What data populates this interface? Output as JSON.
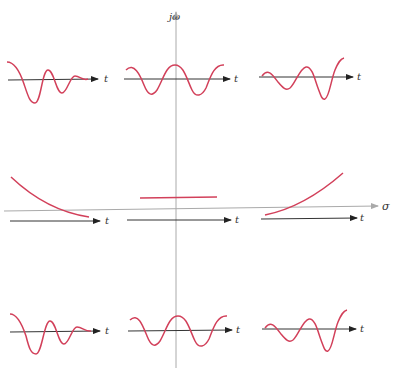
{
  "figure": {
    "axes": {
      "vertical_label": "jω",
      "horizontal_label": "σ"
    },
    "time_axis_label": "t",
    "colors": {
      "signal": "#d2405a",
      "time_axis": "#333333",
      "s_plane_axis": "#aaaaaa"
    },
    "panels": [
      {
        "row": "top",
        "col": "left",
        "description": "decaying oscillation (LHP complex pole)",
        "t_label": "t"
      },
      {
        "row": "top",
        "col": "center",
        "description": "constant-amplitude oscillation (jω-axis pole)",
        "t_label": "t"
      },
      {
        "row": "top",
        "col": "right",
        "description": "growing oscillation (RHP complex pole)",
        "t_label": "t"
      },
      {
        "row": "middle",
        "col": "left",
        "description": "decaying exponential (LHP real pole)",
        "t_label": "t"
      },
      {
        "row": "middle",
        "col": "center",
        "description": "constant (pole at origin)",
        "t_label": "t"
      },
      {
        "row": "middle",
        "col": "right",
        "description": "growing exponential (RHP real pole)",
        "t_label": "t"
      },
      {
        "row": "bottom",
        "col": "left",
        "description": "decaying oscillation (LHP complex pole)",
        "t_label": "t"
      },
      {
        "row": "bottom",
        "col": "center",
        "description": "constant-amplitude oscillation (jω-axis pole)",
        "t_label": "t"
      },
      {
        "row": "bottom",
        "col": "right",
        "description": "growing oscillation (RHP complex pole)",
        "t_label": "t"
      }
    ]
  }
}
